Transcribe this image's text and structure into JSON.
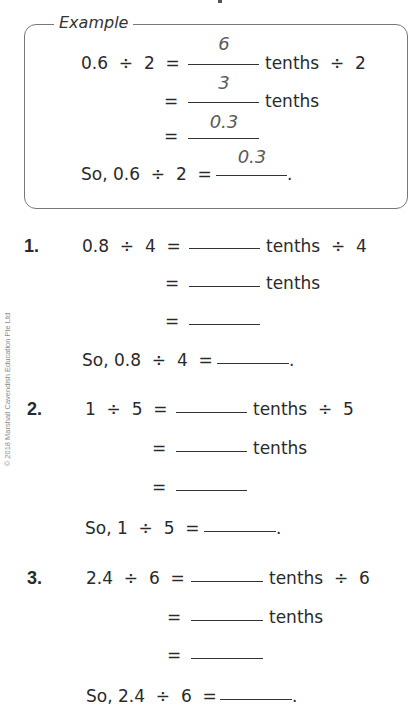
{
  "copyright": "© 2018 Marshall Cavendish Education Pte Ltd",
  "example": {
    "label": "Example",
    "rows": [
      {
        "lhs": "0.6  ÷  2  =",
        "answer": "6",
        "suffix": "tenths  ÷  2"
      },
      {
        "lhs": "=",
        "answer": "3",
        "suffix": "tenths"
      },
      {
        "lhs": "=",
        "answer": "0.3",
        "suffix": ""
      },
      {
        "lhs": "So, 0.6  ÷  2  =",
        "answer": "0.3",
        "suffix": "."
      }
    ]
  },
  "questions": [
    {
      "number": "1.",
      "rows": [
        {
          "lhs": "0.8  ÷  4  =",
          "answer": "",
          "suffix": "tenths  ÷  4"
        },
        {
          "lhs": "=",
          "answer": "",
          "suffix": "tenths"
        },
        {
          "lhs": "=",
          "answer": "",
          "suffix": ""
        },
        {
          "lhs": "So, 0.8  ÷  4  =",
          "answer": "",
          "suffix": "."
        }
      ]
    },
    {
      "number": "2.",
      "rows": [
        {
          "lhs": "1  ÷  5  =",
          "answer": "",
          "suffix": "tenths  ÷  5"
        },
        {
          "lhs": "=",
          "answer": "",
          "suffix": "tenths"
        },
        {
          "lhs": "=",
          "answer": "",
          "suffix": ""
        },
        {
          "lhs": "So, 1  ÷  5  =",
          "answer": "",
          "suffix": "."
        }
      ]
    },
    {
      "number": "3.",
      "rows": [
        {
          "lhs": "2.4  ÷  6  =",
          "answer": "",
          "suffix": "tenths  ÷  6"
        },
        {
          "lhs": "=",
          "answer": "",
          "suffix": "tenths"
        },
        {
          "lhs": "=",
          "answer": "",
          "suffix": ""
        },
        {
          "lhs": "So, 2.4  ÷  6  =",
          "answer": "",
          "suffix": "."
        }
      ]
    }
  ]
}
